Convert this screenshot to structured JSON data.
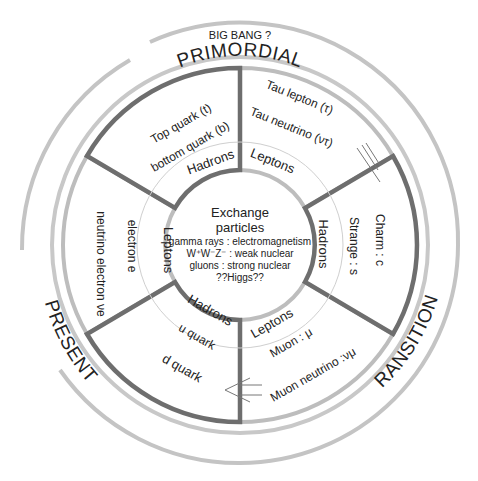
{
  "title": {
    "top": "PRIMORDIAL",
    "subtitle": "BIG BANG ?"
  },
  "eras": {
    "right": "TRANSITION ?",
    "left": "PRESENT"
  },
  "hub": {
    "title_line1": "Exchange",
    "title_line2": "particles",
    "lines": [
      "gamma rays : electromagnetism",
      "W⁺W⁻Z⁻ : weak nuclear",
      "gluons : strong nuclear",
      "??Higgs??"
    ]
  },
  "sectors": [
    {
      "id": "gen3-hadrons",
      "category": "Hadrons",
      "items": [
        "Top quark (t)",
        "bottom quark (b)"
      ],
      "border": "dark"
    },
    {
      "id": "gen3-leptons",
      "category": "Leptons",
      "items": [
        "Tau lepton (τ)",
        "Tau neutrino (ντ)"
      ],
      "border": "light"
    },
    {
      "id": "gen2-hadrons",
      "category": "Hadrons",
      "items": [
        "Strange : s",
        "Charm : c"
      ],
      "border": "dark"
    },
    {
      "id": "gen2-leptons",
      "category": "Leptons",
      "items": [
        "Muon : μ",
        "Muon neutrino :νμ"
      ],
      "border": "light"
    },
    {
      "id": "gen1-hadrons",
      "category": "Hadrons",
      "items": [
        "u quark",
        "d quark"
      ],
      "border": "dark"
    },
    {
      "id": "gen1-leptons",
      "category": "Leptons",
      "items": [
        "electron e",
        "neutrino electron νe"
      ],
      "border": "light"
    }
  ],
  "colors": {
    "dark_border": "#6e6e6e",
    "light_border": "#bdbdbd",
    "ring": "#c4c4c4",
    "thin": "#cfcfcf"
  }
}
